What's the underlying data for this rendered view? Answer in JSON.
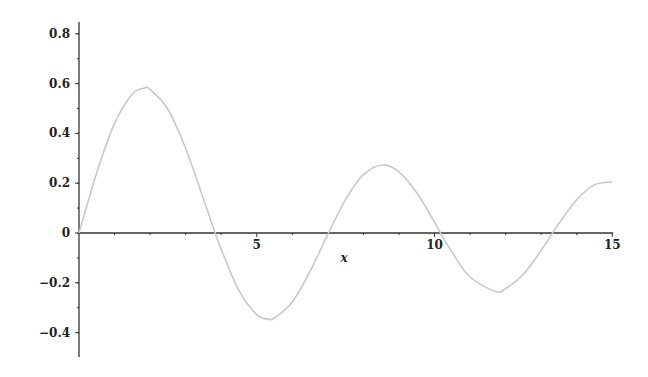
{
  "chart_data": {
    "type": "line",
    "title": "",
    "xlabel": "x",
    "ylabel": "",
    "xlim": [
      0,
      15
    ],
    "ylim": [
      -0.5,
      0.85
    ],
    "grid": false,
    "legend": null,
    "x_ticks": [
      5,
      10,
      15
    ],
    "x_tick_labels": [
      "5",
      "10",
      "15"
    ],
    "y_ticks": [
      0.8,
      0.6,
      0.4,
      0.2,
      0,
      -0.2,
      -0.4
    ],
    "y_tick_labels": [
      "0.8",
      "0.6",
      "0.4",
      "0.2",
      "0",
      "−0.2",
      "−0.4"
    ],
    "series": [
      {
        "name": "curve",
        "color": "#c8c8c8",
        "x": [
          0,
          0.5,
          1,
          1.5,
          1.84,
          2,
          2.5,
          3,
          3.5,
          3.83,
          4,
          4.5,
          5,
          5.33,
          5.5,
          6,
          6.5,
          7,
          7.02,
          7.5,
          8,
          8.54,
          9,
          9.5,
          10,
          10.17,
          10.5,
          11,
          11.71,
          12,
          12.5,
          13,
          13.32,
          13.5,
          14,
          14.5,
          15
        ],
        "values": [
          0,
          0.2423,
          0.4401,
          0.5579,
          0.5819,
          0.5767,
          0.4971,
          0.3391,
          0.1374,
          0,
          -0.066,
          -0.2311,
          -0.3276,
          -0.3459,
          -0.3414,
          -0.2767,
          -0.1538,
          -0.0047,
          0,
          0.1352,
          0.2346,
          0.2733,
          0.2453,
          0.1613,
          0.0435,
          0,
          -0.0789,
          -0.1768,
          -0.2346,
          -0.2234,
          -0.1655,
          -0.0703,
          0,
          0.038,
          0.1334,
          0.1934,
          0.2051
        ]
      }
    ]
  },
  "axes": {
    "x_title": "x",
    "axis_color": "#333333"
  }
}
